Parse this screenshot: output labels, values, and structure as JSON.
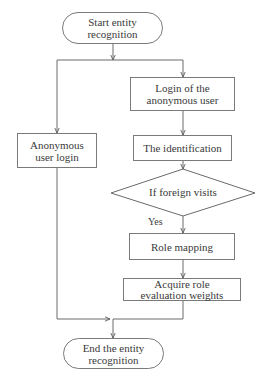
{
  "diagram": {
    "type": "flowchart",
    "nodes": {
      "start": {
        "label": "Start entity recognition",
        "line1": "Start entity",
        "line2": "recognition",
        "shape": "terminal"
      },
      "anon_login": {
        "label": "Anonymous user login",
        "line1": "Anonymous",
        "line2": "user login",
        "shape": "process"
      },
      "login_anon_user": {
        "label": "Login of the anonymous user",
        "line1": "Login of the",
        "line2": "anonymous user",
        "shape": "process"
      },
      "identification": {
        "label": "The identification",
        "shape": "process"
      },
      "foreign_visits": {
        "label": "If foreign visits",
        "shape": "decision"
      },
      "role_mapping": {
        "label": "Role mapping",
        "shape": "process"
      },
      "acquire_weights": {
        "label": "Acquire role evaluation weights",
        "line1": "Acquire role",
        "line2": "evaluation weights",
        "shape": "process"
      },
      "end": {
        "label": "End the entity recognition",
        "line1": "End the entity",
        "line2": "recognition",
        "shape": "terminal"
      }
    },
    "edges": [
      {
        "from": "start",
        "to": "anon_login"
      },
      {
        "from": "start",
        "to": "login_anon_user"
      },
      {
        "from": "login_anon_user",
        "to": "identification"
      },
      {
        "from": "identification",
        "to": "foreign_visits"
      },
      {
        "from": "foreign_visits",
        "to": "role_mapping",
        "label": "Yes"
      },
      {
        "from": "role_mapping",
        "to": "acquire_weights"
      },
      {
        "from": "anon_login",
        "to": "end"
      },
      {
        "from": "acquire_weights",
        "to": "end"
      }
    ],
    "edge_labels": {
      "yes": "Yes"
    }
  }
}
